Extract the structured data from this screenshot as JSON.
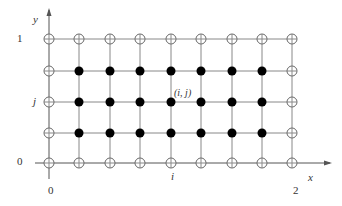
{
  "diagram": {
    "type": "finite-difference-grid",
    "colors": {
      "line": "#888888",
      "axis": "#555555",
      "filled": "#000000",
      "open_stroke": "#666666",
      "text": "#333333"
    },
    "grid": {
      "columns_x": [
        49,
        79,
        110,
        140,
        171,
        201,
        232,
        262,
        292
      ],
      "rows_y": [
        39,
        71,
        102,
        133,
        163
      ],
      "interior_filled": true,
      "boundary_open": true
    },
    "highlight_node": {
      "col": 4,
      "row": 2,
      "label": "(i, j)"
    },
    "axes": {
      "x_label": "x",
      "y_label": "y",
      "x_ticks": [
        {
          "label": "0",
          "col": 0
        },
        {
          "label": "i",
          "col": 4
        },
        {
          "label": "2",
          "col": 8
        }
      ],
      "y_ticks": [
        {
          "label": "1",
          "row": 0
        },
        {
          "label": "j",
          "row": 2
        },
        {
          "label": "0",
          "row": 4
        }
      ]
    }
  }
}
